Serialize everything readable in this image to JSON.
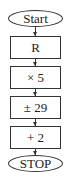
{
  "flowchart": {
    "start": "Start",
    "steps": [
      "R",
      "× 5",
      "± 29",
      "+ 2"
    ],
    "end": "STOP"
  }
}
